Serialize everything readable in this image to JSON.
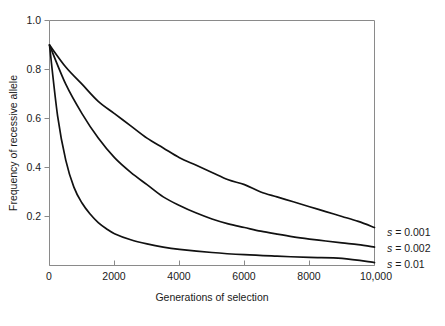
{
  "figure": {
    "background_color": "#ffffff",
    "curve_color": "#111111",
    "axis_color": "#8a8a8a"
  },
  "chart_data": {
    "type": "line",
    "title": "",
    "subtitle": "",
    "xlabel": "Generations of selection",
    "ylabel": "Frequency of recessive allele",
    "xlim": [
      0,
      10000
    ],
    "ylim": [
      0,
      1.0
    ],
    "grid": false,
    "legend_position": "right-of-plot-at-curve-ends",
    "x_ticks": [
      0,
      2000,
      4000,
      6000,
      8000,
      10000
    ],
    "x_tick_labels": [
      "0",
      "2000",
      "4000",
      "6000",
      "8000",
      "10,000"
    ],
    "y_ticks": [
      0.2,
      0.4,
      0.6,
      0.8,
      1.0
    ],
    "y_tick_labels": [
      "0.2",
      "0.4",
      "0.6",
      "0.8",
      "1.0"
    ],
    "initial_frequency": 0.9,
    "series": [
      {
        "name": "s = 0.001",
        "label_italic_prefix": "s",
        "label_rest": " = 0.001",
        "selection_coefficient": 0.001,
        "x": [
          0,
          500,
          1000,
          1500,
          2000,
          2500,
          3000,
          3500,
          4000,
          4500,
          5000,
          5500,
          6000,
          6500,
          7000,
          7500,
          8000,
          8500,
          9000,
          9500,
          10000
        ],
        "values": [
          0.9,
          0.81,
          0.74,
          0.67,
          0.62,
          0.57,
          0.52,
          0.48,
          0.44,
          0.41,
          0.38,
          0.35,
          0.33,
          0.3,
          0.28,
          0.26,
          0.24,
          0.22,
          0.2,
          0.18,
          0.155
        ]
      },
      {
        "name": "s = 0.002",
        "label_italic_prefix": "s",
        "label_rest": " = 0.002",
        "selection_coefficient": 0.002,
        "x": [
          0,
          500,
          1000,
          1500,
          2000,
          2500,
          3000,
          3500,
          4000,
          4500,
          5000,
          5500,
          6000,
          6500,
          7000,
          7500,
          8000,
          8500,
          9000,
          9500,
          10000
        ],
        "values": [
          0.9,
          0.74,
          0.62,
          0.52,
          0.44,
          0.38,
          0.33,
          0.28,
          0.245,
          0.215,
          0.19,
          0.17,
          0.155,
          0.14,
          0.128,
          0.117,
          0.108,
          0.1,
          0.092,
          0.085,
          0.075
        ]
      },
      {
        "name": "s = 0.01",
        "label_italic_prefix": "s",
        "label_rest": " = 0.01",
        "selection_coefficient": 0.01,
        "x": [
          0,
          250,
          500,
          750,
          1000,
          1250,
          1500,
          1750,
          2000,
          2500,
          3000,
          3500,
          4000,
          5000,
          6000,
          7000,
          8000,
          9000,
          10000
        ],
        "values": [
          0.9,
          0.61,
          0.43,
          0.32,
          0.255,
          0.21,
          0.175,
          0.15,
          0.13,
          0.105,
          0.088,
          0.075,
          0.066,
          0.053,
          0.044,
          0.038,
          0.033,
          0.029,
          0.012
        ]
      }
    ]
  }
}
